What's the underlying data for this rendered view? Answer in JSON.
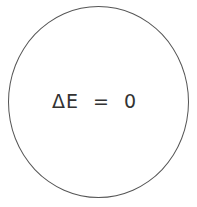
{
  "diagram": {
    "shape": "circle",
    "label": "ΔE  =  0",
    "stroke_color": "#555555"
  }
}
